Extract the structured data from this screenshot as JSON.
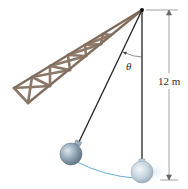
{
  "figure": {
    "angle_label": "θ",
    "length_label": "12 m",
    "colors": {
      "truss_fill": "#8a7565",
      "truss_edge": "#5a4a3e",
      "cable": "#1a1a1a",
      "ball_light": "#dfe8f0",
      "ball_dark": "#6f8797",
      "path_arc": "#6aaed4",
      "dimension_line": "#555555"
    },
    "components": [
      {
        "id": "truss-boom",
        "label": "crane boom (lattice truss)"
      },
      {
        "id": "pivot",
        "label": "pivot point at boom tip"
      },
      {
        "id": "cable-vertical",
        "label": "cable, vertical position"
      },
      {
        "id": "cable-displaced",
        "label": "cable, displaced by angle θ"
      },
      {
        "id": "ball-displaced",
        "label": "wrecking ball, displaced"
      },
      {
        "id": "ball-rest",
        "label": "wrecking ball, lowest position"
      },
      {
        "id": "swing-path",
        "label": "circular swing path"
      },
      {
        "id": "dimension",
        "label": "cable length 12 m"
      }
    ]
  }
}
